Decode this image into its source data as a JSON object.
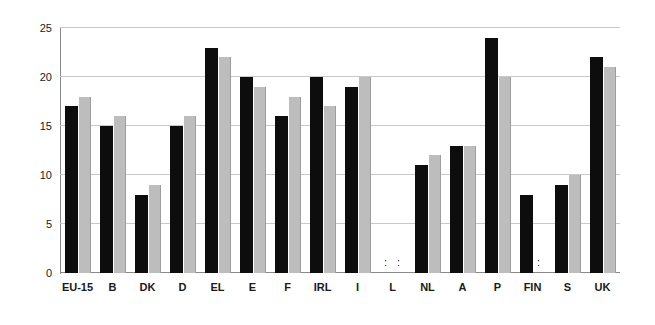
{
  "chart_data": {
    "type": "bar",
    "title": "",
    "subtitle": "",
    "xlabel": "",
    "ylabel": "",
    "ylim": [
      0,
      25
    ],
    "yticks": [
      0,
      5,
      10,
      15,
      20,
      25
    ],
    "ytick_labels": [
      "0",
      "5",
      "10",
      "15",
      "20",
      "25"
    ],
    "grid": true,
    "legend": "none",
    "no_data_marker": ":",
    "categories": [
      "EU-15",
      "B",
      "DK",
      "D",
      "EL",
      "E",
      "F",
      "IRL",
      "I",
      "L",
      "NL",
      "A",
      "P",
      "FIN",
      "S",
      "UK"
    ],
    "series": [
      {
        "name": "series-1",
        "color": "#0d0d0d",
        "values": [
          17,
          15,
          8,
          15,
          23,
          20,
          16,
          20,
          19,
          null,
          11,
          13,
          24,
          8,
          9,
          22
        ]
      },
      {
        "name": "series-2",
        "color": "#bdbdbd",
        "values": [
          18,
          16,
          9,
          16,
          22,
          19,
          18,
          17,
          20,
          null,
          12,
          13,
          20,
          null,
          10,
          21
        ]
      }
    ]
  },
  "colors": {
    "series_1": "#0d0d0d",
    "series_2": "#bdbdbd",
    "gridline": "#c9c9c9",
    "axis": "#8a8a8a",
    "text": "#1a1a1a",
    "background": "#ffffff"
  }
}
